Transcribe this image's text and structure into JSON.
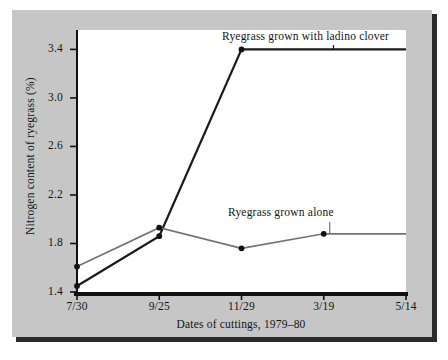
{
  "chart_data": {
    "type": "line",
    "title": "",
    "xlabel": "Dates of cuttings, 1979–80",
    "ylabel": "Nitrogen content of ryegrass (%)",
    "categories": [
      "7/30",
      "9/25",
      "11/29",
      "3/19",
      "5/14"
    ],
    "xtick_labels": [
      "7/30",
      "9/25",
      "11/29",
      "3/19",
      "5/14"
    ],
    "ytick_labels": [
      "1.4",
      "1.8",
      "2.2",
      "2.6",
      "3.0",
      "3.4"
    ],
    "ytick_values": [
      1.4,
      1.8,
      2.2,
      2.6,
      3.0,
      3.4
    ],
    "ylim": [
      1.4,
      3.56
    ],
    "grid": false,
    "legend_position": "inline-annotation",
    "series": [
      {
        "name": "Ryegrass grown with ladino clover",
        "color": "#1a1a1a",
        "marker": "filled-circle",
        "values": [
          1.45,
          1.86,
          3.4,
          3.4,
          3.4
        ],
        "markers_drawn": [
          true,
          true,
          true,
          false,
          false
        ]
      },
      {
        "name": "Ryegrass grown alone",
        "color": "#737373",
        "marker": "filled-circle",
        "values": [
          1.61,
          1.93,
          1.76,
          1.88,
          1.88
        ],
        "markers_drawn": [
          true,
          true,
          true,
          true,
          false
        ]
      }
    ],
    "annotations": [
      {
        "text": "Ryegrass grown with ladino clover",
        "series": "Ryegrass grown with ladino clover"
      },
      {
        "text": "Ryegrass grown alone",
        "series": "Ryegrass grown alone"
      }
    ]
  },
  "colors": {
    "panel_background": "#c6c6c6",
    "plot_background": "#ffffff",
    "axis": "#111111",
    "shadow": "#2b2b2b",
    "series_clover": "#1a1a1a",
    "series_alone": "#737373"
  }
}
